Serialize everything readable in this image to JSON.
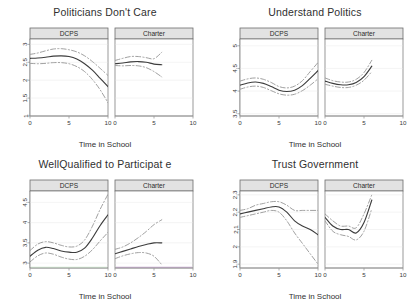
{
  "figure": {
    "background": "#ffffff",
    "line_color": "#3d3d3d",
    "ci_color": "#8f8f8f",
    "strip_fill": "#e2e2e2",
    "strip_border": "#6d6d6d",
    "axis_color": "#9a9a9a",
    "grid_color": "#efefef",
    "accent_green": "#cfe6cf",
    "accent_purple": "#c3a8cc"
  },
  "shared": {
    "xlabel": "Time in School",
    "xticks": [
      "0",
      "5",
      "10"
    ],
    "strips": [
      "DCPS",
      "Charter"
    ]
  },
  "chart_data": [
    {
      "type": "line",
      "title": "Politicians Don't Care",
      "xlabel": "Time in School",
      "ylabel": "",
      "xlim": [
        0,
        10
      ],
      "ylim": [
        1,
        3.15
      ],
      "xticks": [
        0,
        5,
        10
      ],
      "yticks": [
        1,
        1.5,
        2,
        2.5,
        3
      ],
      "ytick_labels": [
        "1",
        "1.5",
        "2",
        "2.5",
        "3"
      ],
      "grid": true,
      "legend": "none",
      "facets": [
        {
          "name": "DCPS",
          "x": [
            0,
            1,
            2,
            3,
            4,
            5,
            6,
            7,
            8,
            9,
            10
          ],
          "series": [
            {
              "name": "fit",
              "style": "solid",
              "values": [
                2.61,
                2.62,
                2.64,
                2.67,
                2.68,
                2.66,
                2.59,
                2.46,
                2.28,
                2.05,
                1.82
              ]
            },
            {
              "name": "upper",
              "style": "dashed",
              "values": [
                2.72,
                2.76,
                2.82,
                2.87,
                2.88,
                2.85,
                2.79,
                2.68,
                2.52,
                2.33,
                2.13
              ]
            },
            {
              "name": "lower",
              "style": "dashed",
              "values": [
                2.47,
                2.46,
                2.47,
                2.49,
                2.49,
                2.46,
                2.38,
                2.24,
                2.02,
                1.73,
                1.37
              ]
            }
          ]
        },
        {
          "name": "Charter",
          "x": [
            0,
            1,
            2,
            3,
            4,
            5,
            6
          ],
          "series": [
            {
              "name": "fit",
              "style": "solid",
              "values": [
                2.46,
                2.48,
                2.51,
                2.52,
                2.5,
                2.45,
                2.43
              ]
            },
            {
              "name": "upper",
              "style": "dashed",
              "values": [
                2.55,
                2.61,
                2.66,
                2.66,
                2.63,
                2.6,
                2.78
              ]
            },
            {
              "name": "lower",
              "style": "dashed",
              "values": [
                2.41,
                2.4,
                2.41,
                2.4,
                2.35,
                2.24,
                2.09
              ]
            }
          ]
        }
      ]
    },
    {
      "type": "line",
      "title": "Understand Politics",
      "xlabel": "Time in School",
      "ylabel": "",
      "xlim": [
        0,
        10
      ],
      "ylim": [
        3.45,
        5.15
      ],
      "xticks": [
        0,
        5,
        10
      ],
      "yticks": [
        3.5,
        4,
        4.5,
        5
      ],
      "ytick_labels": [
        "3.5",
        "4",
        "4.5",
        "5"
      ],
      "grid": true,
      "legend": "none",
      "facets": [
        {
          "name": "DCPS",
          "x": [
            0,
            1,
            2,
            3,
            4,
            5,
            6,
            7,
            8,
            9,
            10
          ],
          "series": [
            {
              "name": "fit",
              "style": "solid",
              "values": [
                4.13,
                4.18,
                4.2,
                4.17,
                4.1,
                4.02,
                3.99,
                4.02,
                4.12,
                4.28,
                4.45
              ]
            },
            {
              "name": "upper",
              "style": "dashed",
              "values": [
                4.22,
                4.27,
                4.29,
                4.26,
                4.19,
                4.1,
                4.07,
                4.11,
                4.23,
                4.43,
                4.63
              ]
            },
            {
              "name": "lower",
              "style": "dashed",
              "values": [
                4.04,
                4.09,
                4.11,
                4.08,
                4.01,
                3.94,
                3.91,
                3.93,
                4.01,
                4.13,
                4.27
              ]
            }
          ]
        },
        {
          "name": "Charter",
          "x": [
            0,
            1,
            2,
            3,
            4,
            5,
            6
          ],
          "series": [
            {
              "name": "fit",
              "style": "solid",
              "values": [
                4.22,
                4.17,
                4.14,
                4.14,
                4.19,
                4.32,
                4.55
              ]
            },
            {
              "name": "upper",
              "style": "dashed",
              "values": [
                4.29,
                4.23,
                4.2,
                4.2,
                4.26,
                4.41,
                4.68
              ]
            },
            {
              "name": "lower",
              "style": "dashed",
              "values": [
                4.15,
                4.11,
                4.08,
                4.08,
                4.13,
                4.24,
                4.43
              ]
            }
          ]
        }
      ]
    },
    {
      "type": "line",
      "title": "WellQualified to Participat  e",
      "xlabel": "Time in School",
      "ylabel": "",
      "xlim": [
        0,
        10
      ],
      "ylim": [
        2.88,
        4.78
      ],
      "xticks": [
        0,
        5,
        10
      ],
      "yticks": [
        3,
        3.5,
        4,
        4.5
      ],
      "ytick_labels": [
        "3",
        "3.5",
        "4",
        "4.5"
      ],
      "grid": true,
      "legend": "none",
      "facets": [
        {
          "name": "DCPS",
          "x": [
            0,
            1,
            2,
            3,
            4,
            5,
            6,
            7,
            8,
            9,
            10
          ],
          "series": [
            {
              "name": "fit",
              "style": "solid",
              "values": [
                3.17,
                3.32,
                3.39,
                3.36,
                3.3,
                3.27,
                3.27,
                3.37,
                3.62,
                3.93,
                4.19
              ]
            },
            {
              "name": "upper",
              "style": "dashed",
              "values": [
                3.31,
                3.47,
                3.53,
                3.5,
                3.44,
                3.4,
                3.42,
                3.57,
                3.91,
                4.33,
                4.7
              ]
            },
            {
              "name": "lower",
              "style": "dashed",
              "values": [
                3.03,
                3.18,
                3.25,
                3.22,
                3.15,
                3.1,
                3.09,
                3.17,
                3.33,
                3.55,
                3.76
              ]
            }
          ]
        },
        {
          "name": "Charter",
          "x": [
            0,
            1,
            2,
            3,
            4,
            5,
            6
          ],
          "series": [
            {
              "name": "fit",
              "style": "solid",
              "values": [
                3.23,
                3.29,
                3.35,
                3.41,
                3.46,
                3.5,
                3.5
              ]
            },
            {
              "name": "upper",
              "style": "dashed",
              "values": [
                3.34,
                3.4,
                3.5,
                3.63,
                3.78,
                3.95,
                4.07
              ]
            },
            {
              "name": "lower",
              "style": "dashed",
              "values": [
                3.11,
                3.18,
                3.23,
                3.26,
                3.25,
                3.17,
                2.96
              ]
            }
          ]
        }
      ]
    },
    {
      "type": "line",
      "title": "Trust Government",
      "xlabel": "Time in School",
      "ylabel": "",
      "xlim": [
        0,
        10
      ],
      "ylim": [
        1.878,
        2.322
      ],
      "xticks": [
        0,
        5,
        10
      ],
      "yticks": [
        1.9,
        2.0,
        2.1,
        2.2,
        2.3
      ],
      "ytick_labels": [
        "1.9",
        "2",
        "2.1",
        "2.2",
        "2.3"
      ],
      "grid": true,
      "legend": "none",
      "facets": [
        {
          "name": "DCPS",
          "x": [
            0,
            1,
            2,
            3,
            4,
            5,
            6,
            7,
            8,
            9,
            10
          ],
          "series": [
            {
              "name": "fit",
              "style": "solid",
              "values": [
                2.19,
                2.2,
                2.21,
                2.22,
                2.23,
                2.23,
                2.2,
                2.15,
                2.12,
                2.1,
                2.07
              ]
            },
            {
              "name": "upper",
              "style": "dashed",
              "values": [
                2.21,
                2.22,
                2.24,
                2.25,
                2.26,
                2.26,
                2.24,
                2.21,
                2.21,
                2.21,
                2.21
              ]
            },
            {
              "name": "lower",
              "style": "dashed",
              "values": [
                2.17,
                2.18,
                2.19,
                2.2,
                2.21,
                2.2,
                2.15,
                2.08,
                2.02,
                1.96,
                1.9
              ]
            }
          ]
        },
        {
          "name": "Charter",
          "x": [
            0,
            1,
            2,
            3,
            4,
            5,
            6
          ],
          "series": [
            {
              "name": "fit",
              "style": "solid",
              "values": [
                2.17,
                2.12,
                2.1,
                2.1,
                2.08,
                2.14,
                2.27
              ]
            },
            {
              "name": "upper",
              "style": "dashed",
              "values": [
                2.19,
                2.15,
                2.12,
                2.12,
                2.11,
                2.19,
                2.3
              ]
            },
            {
              "name": "lower",
              "style": "dashed",
              "values": [
                2.15,
                2.09,
                2.07,
                2.06,
                2.04,
                2.09,
                2.22
              ]
            }
          ]
        }
      ]
    }
  ]
}
